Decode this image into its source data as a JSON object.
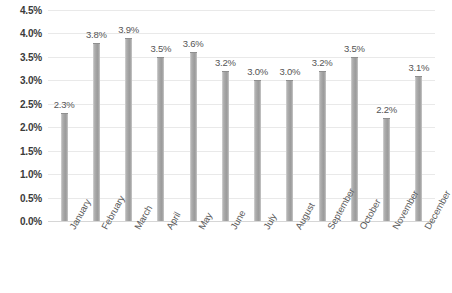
{
  "chart_data": {
    "type": "bar",
    "title": "",
    "subtitle": "",
    "xlabel": "",
    "ylabel": "",
    "categories": [
      "January",
      "February",
      "March",
      "April",
      "May",
      "June",
      "July",
      "August",
      "September",
      "October",
      "November",
      "December"
    ],
    "values": [
      2.3,
      3.8,
      3.9,
      3.5,
      3.6,
      3.2,
      3.0,
      3.0,
      3.2,
      3.5,
      2.2,
      3.1
    ],
    "value_labels": [
      "2.3%",
      "3.8%",
      "3.9%",
      "3.5%",
      "3.6%",
      "3.2%",
      "3.0%",
      "3.0%",
      "3.2%",
      "3.5%",
      "2.2%",
      "3.1%"
    ],
    "ylim": [
      0.0,
      4.5
    ],
    "ytick_values": [
      0.0,
      0.5,
      1.0,
      1.5,
      2.0,
      2.5,
      3.0,
      3.5,
      4.0,
      4.5
    ],
    "ytick_labels": [
      "0.0%",
      "0.5%",
      "1.0%",
      "1.5%",
      "2.0%",
      "2.5%",
      "3.0%",
      "3.5%",
      "4.0%",
      "4.5%"
    ],
    "grid": "horizontal",
    "legend": "none",
    "series_name": "",
    "colors": {
      "bar": "#a3a3a3",
      "bar_edge": "#8f8f8f",
      "gridline": "#e9e9e9",
      "axis_line": "#d6d6d6",
      "ytick_text": "#3b3b3b",
      "xtick_text": "#5a5a5a",
      "data_label_text": "#555555",
      "background": "#ffffff"
    }
  }
}
